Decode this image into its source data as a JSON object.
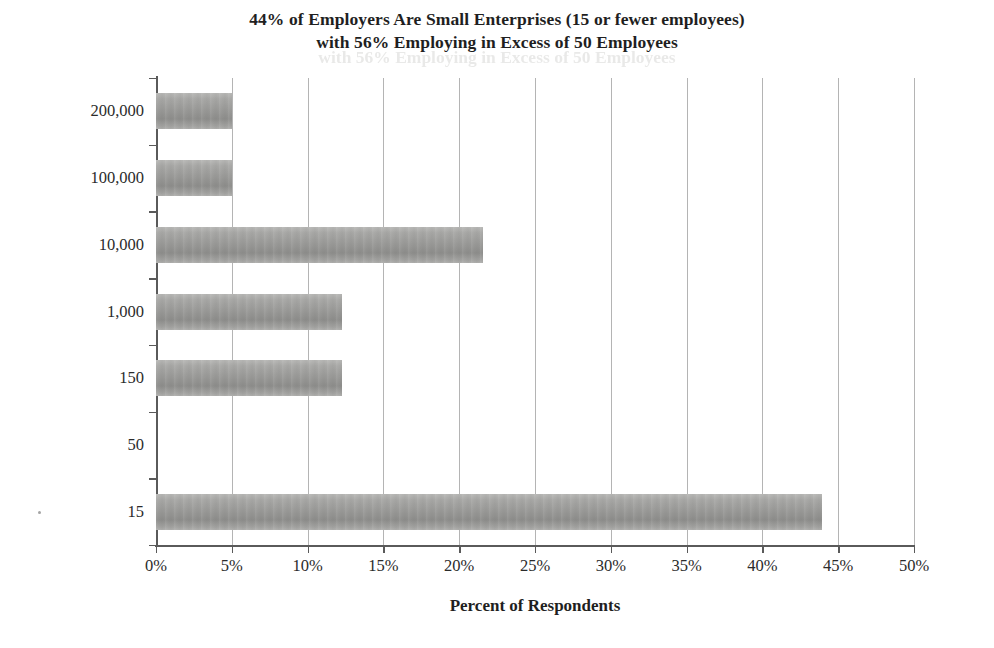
{
  "chart_data": {
    "type": "bar",
    "orientation": "horizontal",
    "title": "44% of Employers Are Small Enterprises (15 or fewer employees) with 56% Employing in Excess of 50 Employees",
    "title_lines": [
      "44% of Employers Are Small Enterprises (15 or fewer employees)",
      "with 56% Employing in Excess of 50 Employees"
    ],
    "xlabel": "Percent of Respondents",
    "ylabel": "Number of Employees",
    "categories": [
      "200,000",
      "100,000",
      "10,000",
      "1,000",
      "150",
      "50",
      "15"
    ],
    "values": [
      5.0,
      5.0,
      21.6,
      12.3,
      12.3,
      0.0,
      43.9
    ],
    "value_labels": [
      "5%",
      "5%",
      "21.6%",
      "12.3%",
      "12.3%",
      "0%",
      "43.9%"
    ],
    "xlim": [
      0,
      50
    ],
    "xticks": [
      0,
      5,
      10,
      15,
      20,
      25,
      30,
      35,
      40,
      45,
      50
    ],
    "xtick_labels": [
      "0%",
      "5%",
      "10%",
      "15%",
      "20%",
      "25%",
      "30%",
      "35%",
      "40%",
      "45%",
      "50%"
    ],
    "grid": "vertical",
    "legend": "none",
    "bar_color": "#9a9a98",
    "gridline_color": "#b4b4b4",
    "axis_color": "#5a5a5a",
    "text_color": "#2b2b2b"
  },
  "ghost_text": "with 56% Employing in Excess of 50 Employees"
}
